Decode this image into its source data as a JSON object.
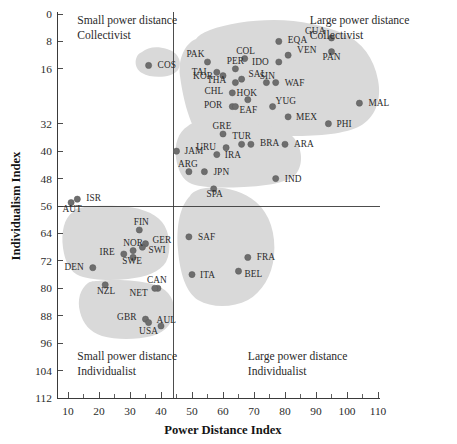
{
  "chart_data": {
    "type": "scatter",
    "title": "",
    "xlabel": "Power Distance Index",
    "ylabel": "Individualism Index",
    "xlim": [
      5,
      115
    ],
    "ylim": [
      0,
      112
    ],
    "y_axis_inverted": true,
    "grid": false,
    "legend": false,
    "x_ticks": [
      10,
      20,
      30,
      40,
      50,
      60,
      70,
      80,
      90,
      100,
      110
    ],
    "x_tick_labels": [
      "10",
      "20",
      "30",
      "40",
      "50",
      "60",
      "70",
      "80",
      "90",
      "100",
      "110"
    ],
    "y_ticks": [
      0,
      8,
      16,
      32,
      40,
      48,
      56,
      64,
      72,
      80,
      88,
      96,
      104,
      112
    ],
    "y_tick_labels": [
      "0",
      "8",
      "16",
      "32",
      "40",
      "48",
      "56",
      "64",
      "72",
      "80",
      "88",
      "96",
      "104",
      "112"
    ],
    "quadrant_divider_x": 44,
    "quadrant_divider_y": 56,
    "annotations": [
      {
        "id": "quad-top-left",
        "line1": "Small power distance",
        "line2": "Collectivist",
        "x": 13,
        "y": 3
      },
      {
        "id": "quad-top-right",
        "line1": "Large power distance",
        "line2": "Collectivist",
        "x": 88,
        "y": 3
      },
      {
        "id": "quad-bottom-left",
        "line1": "Small power distance",
        "line2": "Individualist",
        "x": 13,
        "y": 101
      },
      {
        "id": "quad-bottom-right",
        "line1": "Large power distance",
        "line2": "Individualist",
        "x": 68,
        "y": 101
      }
    ],
    "points": [
      {
        "label": "COS",
        "x": 36,
        "y": 15,
        "lx": 9,
        "ly": 3
      },
      {
        "label": "PAK",
        "x": 55,
        "y": 14,
        "lx": -3,
        "ly": -5
      },
      {
        "label": "COL",
        "x": 67,
        "y": 13,
        "lx": 1,
        "ly": -5
      },
      {
        "label": "EQA",
        "x": 78,
        "y": 8,
        "lx": 9,
        "ly": 2
      },
      {
        "label": "GUA",
        "x": 95,
        "y": 7,
        "lx": -6,
        "ly": -4
      },
      {
        "label": "PER",
        "x": 64,
        "y": 16,
        "lx": 0,
        "ly": -5
      },
      {
        "label": "IDO",
        "x": 78,
        "y": 14,
        "lx": -10,
        "ly": 3
      },
      {
        "label": "VEN",
        "x": 81,
        "y": 12,
        "lx": 9,
        "ly": -2
      },
      {
        "label": "PAN",
        "x": 95,
        "y": 11,
        "lx": 0,
        "ly": 8
      },
      {
        "label": "TAI",
        "x": 58,
        "y": 17,
        "lx": -10,
        "ly": 3
      },
      {
        "label": "SAL",
        "x": 66,
        "y": 19,
        "lx": 7,
        "ly": -2
      },
      {
        "label": "SIN",
        "x": 74,
        "y": 20,
        "lx": 1,
        "ly": -4
      },
      {
        "label": "KOR",
        "x": 60,
        "y": 18,
        "lx": -10,
        "ly": 3
      },
      {
        "label": "THA",
        "x": 64,
        "y": 20,
        "lx": -9,
        "ly": 0
      },
      {
        "label": "WAF",
        "x": 77,
        "y": 20,
        "lx": 9,
        "ly": 3
      },
      {
        "label": "CHL",
        "x": 63,
        "y": 23,
        "lx": -9,
        "ly": 1
      },
      {
        "label": "HOK",
        "x": 68,
        "y": 25,
        "lx": -1,
        "ly": -4
      },
      {
        "label": "POR",
        "x": 63,
        "y": 27,
        "lx": -10,
        "ly": 1
      },
      {
        "label": "EAF",
        "x": 64,
        "y": 27,
        "lx": 4,
        "ly": 6
      },
      {
        "label": "YUG",
        "x": 76,
        "y": 27,
        "lx": 3,
        "ly": -3
      },
      {
        "label": "MAL",
        "x": 104,
        "y": 26,
        "lx": 9,
        "ly": 3
      },
      {
        "label": "MEX",
        "x": 81,
        "y": 30,
        "lx": 8,
        "ly": 3
      },
      {
        "label": "GRE",
        "x": 60,
        "y": 35,
        "lx": -1,
        "ly": -5
      },
      {
        "label": "PHI",
        "x": 94,
        "y": 32,
        "lx": 8,
        "ly": 3
      },
      {
        "label": "URU",
        "x": 61,
        "y": 39,
        "lx": -10,
        "ly": 2
      },
      {
        "label": "TUR",
        "x": 66,
        "y": 38,
        "lx": 0,
        "ly": -5
      },
      {
        "label": "BRA",
        "x": 69,
        "y": 38,
        "lx": 9,
        "ly": 2
      },
      {
        "label": "JAM",
        "x": 45,
        "y": 40,
        "lx": 8,
        "ly": 3
      },
      {
        "label": "ARA",
        "x": 80,
        "y": 38,
        "lx": 9,
        "ly": 3
      },
      {
        "label": "IRA",
        "x": 58,
        "y": 41,
        "lx": 8,
        "ly": 3
      },
      {
        "label": "ARG",
        "x": 49,
        "y": 46,
        "lx": -1,
        "ly": -5
      },
      {
        "label": "JPN",
        "x": 54,
        "y": 46,
        "lx": 9,
        "ly": 3
      },
      {
        "label": "IND",
        "x": 77,
        "y": 48,
        "lx": 9,
        "ly": 3
      },
      {
        "label": "SPA",
        "x": 57,
        "y": 51,
        "lx": 1,
        "ly": 8
      },
      {
        "label": "ISR",
        "x": 13,
        "y": 54,
        "lx": 9,
        "ly": 2
      },
      {
        "label": "AUT",
        "x": 11,
        "y": 55,
        "lx": 1,
        "ly": 9
      },
      {
        "label": "FIN",
        "x": 33,
        "y": 63,
        "lx": 2,
        "ly": -5
      },
      {
        "label": "SAF",
        "x": 49,
        "y": 65,
        "lx": 9,
        "ly": 3
      },
      {
        "label": "GER",
        "x": 35,
        "y": 67,
        "lx": 7,
        "ly": -1
      },
      {
        "label": "NOR",
        "x": 31,
        "y": 69,
        "lx": 0,
        "ly": -5
      },
      {
        "label": "IRE",
        "x": 28,
        "y": 70,
        "lx": -9,
        "ly": 1
      },
      {
        "label": "SWI",
        "x": 34,
        "y": 68,
        "lx": 6,
        "ly": 6
      },
      {
        "label": "SWE",
        "x": 31,
        "y": 71,
        "lx": -1,
        "ly": 7
      },
      {
        "label": "DEN",
        "x": 18,
        "y": 74,
        "lx": -9,
        "ly": 2
      },
      {
        "label": "FRA",
        "x": 68,
        "y": 71,
        "lx": 9,
        "ly": 3
      },
      {
        "label": "BEL",
        "x": 65,
        "y": 75,
        "lx": 6,
        "ly": 6
      },
      {
        "label": "ITA",
        "x": 50,
        "y": 76,
        "lx": 8,
        "ly": 3
      },
      {
        "label": "NZL",
        "x": 22,
        "y": 79,
        "lx": 1,
        "ly": 9
      },
      {
        "label": "CAN",
        "x": 39,
        "y": 80,
        "lx": -1,
        "ly": -5
      },
      {
        "label": "NET",
        "x": 38,
        "y": 80,
        "lx": -7,
        "ly": 8
      },
      {
        "label": "GBR",
        "x": 35,
        "y": 89,
        "lx": -9,
        "ly": 1
      },
      {
        "label": "AUL",
        "x": 36,
        "y": 90,
        "lx": 8,
        "ly": 0
      },
      {
        "label": "USA",
        "x": 40,
        "y": 91,
        "lx": -3,
        "ly": 8
      }
    ],
    "clusters": [
      {
        "name": "costa-rica-blob",
        "path": "M 142 52 C 134 55, 133 68, 142 73 C 152 79, 172 78, 178 70 C 183 62, 178 52, 167 49 C 157 46, 148 47, 142 52 Z"
      },
      {
        "name": "collectivist-blob",
        "path": "M 196 39 C 184 44, 178 60, 180 76 C 182 92, 186 110, 192 124 C 198 137, 210 141, 226 140 C 247 139, 270 137, 292 136 C 320 136, 345 134, 360 126 C 375 118, 382 100, 378 80 C 374 58, 362 42, 344 34 C 326 26, 300 20, 274 20 C 250 20, 226 24, 210 30 C 202 33, 198 36, 196 39 Z"
      },
      {
        "name": "mid-collectivist-blob",
        "path": "M 188 126 C 178 132, 174 145, 176 158 C 178 170, 182 180, 192 184 C 204 188, 222 188, 244 187 C 266 186, 288 183, 296 174 C 304 164, 302 148, 294 138 C 286 128, 270 124, 250 124 C 228 124, 206 122, 196 123 C 192 123, 190 124, 188 126 Z"
      },
      {
        "name": "nordic-blob",
        "path": "M 73 212 C 64 218, 61 232, 63 248 C 65 262, 70 272, 80 276 C 92 280, 110 281, 128 279 C 146 277, 160 272, 166 262 C 172 250, 170 232, 162 222 C 154 212, 138 207, 118 206 C 100 205, 84 206, 76 209 C 74 210, 73 211, 73 212 Z"
      },
      {
        "name": "anglo-blob",
        "path": "M 88 283 C 80 289, 77 300, 80 312 C 83 324, 90 332, 102 336 C 116 340, 136 340, 152 336 C 166 332, 174 322, 174 310 C 174 296, 166 288, 152 284 C 136 280, 114 279, 98 281 C 92 281, 89 282, 88 283 Z"
      },
      {
        "name": "latin-europe-blob",
        "path": "M 190 196 C 180 206, 176 226, 178 250 C 180 274, 186 292, 198 300 C 212 308, 232 308, 248 300 C 262 292, 272 276, 274 256 C 276 234, 270 214, 256 202 C 242 190, 222 186, 206 188 C 198 189, 192 192, 190 196 Z"
      }
    ]
  }
}
